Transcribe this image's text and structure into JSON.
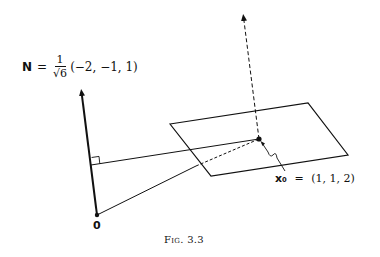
{
  "normal_vector": {
    "symbol": "N",
    "equals": "=",
    "fraction_numerator": "1",
    "fraction_denominator": "√6",
    "components": "(−2, −1, 1)"
  },
  "point": {
    "symbol": "x₀",
    "equals": "=",
    "coordinates": "(1, 1, 2)"
  },
  "origin_label": "0",
  "caption": "Fig. 3.3",
  "geometry": {
    "origin": [
      97,
      215
    ],
    "normal_tip": [
      81,
      88
    ],
    "plane_corners": [
      [
        170,
        124
      ],
      [
        308,
        103
      ],
      [
        348,
        155
      ],
      [
        211,
        176
      ]
    ],
    "x0": [
      259,
      139
    ],
    "dashed_normal_tip": [
      243,
      13
    ],
    "foot_of_perpendicular": [
      91,
      165
    ]
  }
}
